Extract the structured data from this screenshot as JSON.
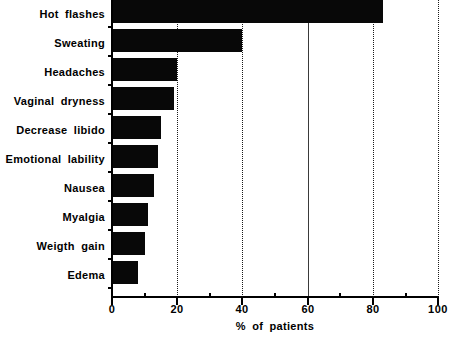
{
  "chart_data": {
    "type": "bar",
    "orientation": "horizontal",
    "title": "",
    "subtitle": "",
    "xlabel": "% of patients",
    "ylabel": "",
    "xlim": [
      0,
      100
    ],
    "grid": true,
    "legend": null,
    "categories": [
      "Hot flashes",
      "Sweating",
      "Headaches",
      "Vaginal dryness",
      "Decrease libido",
      "Emotional lability",
      "Nausea",
      "Myalgia",
      "Weigth gain",
      "Edema"
    ],
    "values": [
      83,
      40,
      20,
      19,
      15,
      14,
      13,
      11,
      10,
      8
    ],
    "xticks": [
      0,
      20,
      40,
      60,
      80,
      100
    ],
    "xtick_labels": [
      "0",
      "20",
      "40",
      "60",
      "80",
      "100"
    ],
    "xticks_minor": [
      10,
      30,
      50,
      70,
      90
    ],
    "gridlines": [
      20,
      40,
      60,
      80,
      100
    ],
    "bar_color": "#080808",
    "axis_color": "#000000",
    "grid_color": "#1a1a1a",
    "background": "#ffffff"
  }
}
